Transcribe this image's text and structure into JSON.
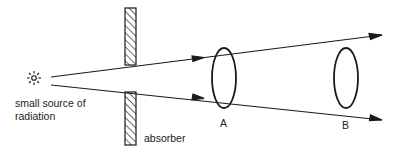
{
  "diagram": {
    "source_label_line1": "small source of",
    "source_label_line2": "radiation",
    "absorber_label": "absorber",
    "surface_a_label": "A",
    "surface_b_label": "B",
    "stroke_color": "#1a1a1a",
    "background_color": "#ffffff"
  }
}
